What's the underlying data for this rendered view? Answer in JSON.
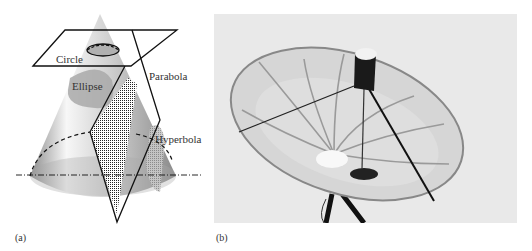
{
  "figure": {
    "panel_a": {
      "caption": "(a)",
      "title": "Conic sections",
      "labels": {
        "circle": "Circle",
        "ellipse": "Ellipse",
        "parabola": "Parabola",
        "hyperbola": "Hyperbola"
      }
    },
    "panel_b": {
      "caption": "(b)",
      "subject": "Parabolic dish antenna"
    }
  },
  "colors": {
    "cone_light": "#f2f2f2",
    "cone_dark": "#9a9a9a",
    "section_fill": "#b8b8b8",
    "outline": "#111111",
    "photo_bg": "#e9e9e9"
  }
}
